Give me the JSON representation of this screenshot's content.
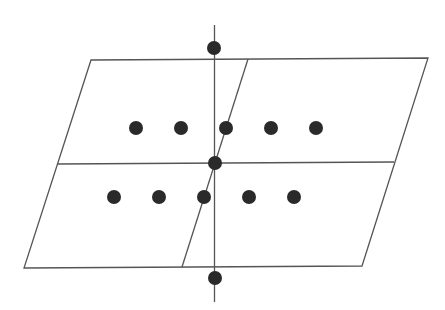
{
  "diagram": {
    "type": "lattice-plane-schematic",
    "width": 445,
    "height": 310,
    "colors": {
      "background": "#ffffff",
      "line": "#555555",
      "dot": "#2a2a2a"
    },
    "parallelogram": {
      "corners": {
        "top_left": [
          91,
          60
        ],
        "top_right": [
          428,
          58
        ],
        "bottom_right": [
          362,
          266
        ],
        "bottom_left": [
          24,
          268
        ]
      },
      "horizontal_divider": {
        "from": [
          57,
          164
        ],
        "to": [
          394,
          162
        ]
      },
      "slanted_divider": {
        "from": [
          248,
          59
        ],
        "to": [
          182,
          267
        ]
      }
    },
    "vertical_axis": {
      "x": 214.5,
      "y_top": 25,
      "y_bottom": 302
    },
    "axis_dots": [
      {
        "name": "axis-dot-top",
        "cx": 214,
        "cy": 48
      },
      {
        "name": "axis-dot-center",
        "cx": 215,
        "cy": 163
      },
      {
        "name": "axis-dot-bottom",
        "cx": 215,
        "cy": 278
      }
    ],
    "dot_rows": [
      {
        "name": "upper-row",
        "y": 128,
        "x": [
          136,
          181,
          226,
          271,
          316
        ]
      },
      {
        "name": "lower-row",
        "y": 197,
        "x": [
          114,
          159,
          204,
          249,
          294
        ]
      }
    ],
    "dot_radius": 7
  }
}
